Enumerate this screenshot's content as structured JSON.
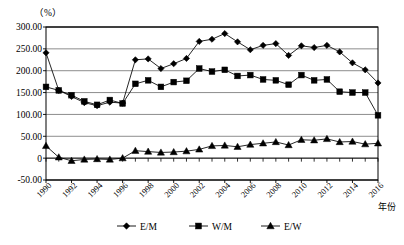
{
  "chart_data": {
    "type": "line",
    "title": "",
    "subtitle": "",
    "unit_label": "（%）",
    "xlabel": "年份",
    "ylabel": "",
    "ylim": [
      -50,
      300
    ],
    "y_ticks": [
      "-50.00",
      "0",
      "50.00",
      "100.00",
      "150.00",
      "200.00",
      "250.00",
      "300.00"
    ],
    "y_tick_values": [
      -50,
      0,
      50,
      100,
      150,
      200,
      250,
      300
    ],
    "grid": true,
    "legend_position": "bottom",
    "x": [
      1990,
      1991,
      1992,
      1993,
      1994,
      1995,
      1996,
      1997,
      1998,
      1999,
      2000,
      2001,
      2002,
      2003,
      2004,
      2005,
      2006,
      2007,
      2008,
      2009,
      2010,
      2011,
      2012,
      2013,
      2014,
      2015,
      2016
    ],
    "x_tick_labels": [
      "1990",
      "1992",
      "1994",
      "1996",
      "1998",
      "2000",
      "2002",
      "2004",
      "2006",
      "2008",
      "2010",
      "2012",
      "2014",
      "2016"
    ],
    "x_tick_values": [
      1990,
      1992,
      1994,
      1996,
      1998,
      2000,
      2002,
      2004,
      2006,
      2008,
      2010,
      2012,
      2014,
      2016
    ],
    "series": [
      {
        "name": "E/M",
        "marker": "diamond",
        "values": [
          241,
          155,
          141,
          127,
          120,
          128,
          126,
          225,
          227,
          205,
          216,
          228,
          267,
          272,
          285,
          266,
          248,
          258,
          262,
          235,
          257,
          253,
          258,
          243,
          218,
          202,
          172
        ]
      },
      {
        "name": "W/M",
        "marker": "square",
        "values": [
          163,
          155,
          144,
          130,
          122,
          133,
          125,
          170,
          178,
          163,
          174,
          177,
          205,
          198,
          202,
          188,
          190,
          180,
          178,
          168,
          190,
          178,
          180,
          152,
          150,
          150,
          98
        ]
      },
      {
        "name": "E/W",
        "marker": "triangle",
        "values": [
          28,
          2,
          -6,
          -3,
          -2,
          -3,
          0,
          17,
          15,
          13,
          14,
          16,
          20,
          28,
          29,
          26,
          31,
          34,
          37,
          30,
          42,
          41,
          44,
          37,
          38,
          32,
          34
        ]
      }
    ]
  },
  "legend": {
    "items": [
      {
        "label": "E/M",
        "marker": "diamond"
      },
      {
        "label": "W/M",
        "marker": "square"
      },
      {
        "label": "E/W",
        "marker": "triangle"
      }
    ]
  }
}
